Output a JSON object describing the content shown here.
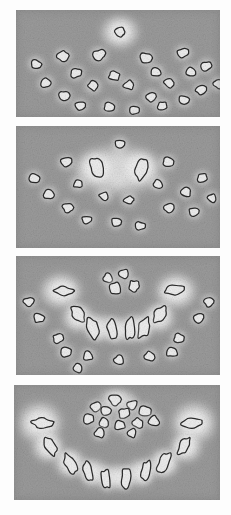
{
  "figure": {
    "panel_count": 4,
    "background_color": "#ffffff",
    "tissue_gray": "#9b9b9b",
    "bone_bright": "#f2f2f2",
    "halo_color": "#e4e4e4",
    "tooth_outline": "#2a2a2a",
    "tooth_fill": "#efefef"
  },
  "panels": [
    {
      "id": "panel-a",
      "label": "A",
      "caption": "Axial section — scattered tooth germs, single erupting crown at midline",
      "x": 16,
      "y": 10,
      "width": 204,
      "height": 107,
      "halos": [
        {
          "cx": 104,
          "cy": 22,
          "rx": 24,
          "ry": 21,
          "intensity": 0.95
        }
      ],
      "teeth": [
        {
          "cx": 104,
          "cy": 22,
          "rx": 5.5,
          "ry": 4.5,
          "rot": 10,
          "shape": "round"
        },
        {
          "cx": 47,
          "cy": 46,
          "rx": 5.5,
          "ry": 4.5,
          "rot": -15,
          "shape": "round"
        },
        {
          "cx": 83,
          "cy": 45,
          "rx": 6.0,
          "ry": 5.0,
          "rot": 5,
          "shape": "round"
        },
        {
          "cx": 130,
          "cy": 48,
          "rx": 5.5,
          "ry": 5.0,
          "rot": 20,
          "shape": "round"
        },
        {
          "cx": 167,
          "cy": 43,
          "rx": 5.5,
          "ry": 4.5,
          "rot": -10,
          "shape": "round"
        },
        {
          "cx": 20,
          "cy": 54,
          "rx": 5.0,
          "ry": 4.2,
          "rot": 25,
          "shape": "round"
        },
        {
          "cx": 190,
          "cy": 56,
          "rx": 5.0,
          "ry": 4.2,
          "rot": -20,
          "shape": "round"
        },
        {
          "cx": 60,
          "cy": 63,
          "rx": 5.2,
          "ry": 4.4,
          "rot": 0,
          "shape": "round"
        },
        {
          "cx": 98,
          "cy": 66,
          "rx": 5.2,
          "ry": 4.4,
          "rot": 15,
          "shape": "round"
        },
        {
          "cx": 140,
          "cy": 62,
          "rx": 5.2,
          "ry": 4.4,
          "rot": -5,
          "shape": "round"
        },
        {
          "cx": 175,
          "cy": 62,
          "rx": 5.0,
          "ry": 4.2,
          "rot": 10,
          "shape": "round"
        },
        {
          "cx": 30,
          "cy": 73,
          "rx": 5.0,
          "ry": 4.2,
          "rot": -25,
          "shape": "round"
        },
        {
          "cx": 202,
          "cy": 74,
          "rx": 4.8,
          "ry": 4.0,
          "rot": 15,
          "shape": "round"
        },
        {
          "cx": 77,
          "cy": 76,
          "rx": 5.2,
          "ry": 4.4,
          "rot": 5,
          "shape": "round"
        },
        {
          "cx": 113,
          "cy": 75,
          "rx": 5.2,
          "ry": 4.4,
          "rot": -12,
          "shape": "round"
        },
        {
          "cx": 153,
          "cy": 73,
          "rx": 5.0,
          "ry": 4.2,
          "rot": 8,
          "shape": "round"
        },
        {
          "cx": 185,
          "cy": 80,
          "rx": 4.8,
          "ry": 4.0,
          "rot": -8,
          "shape": "round"
        },
        {
          "cx": 48,
          "cy": 86,
          "rx": 5.0,
          "ry": 4.2,
          "rot": 18,
          "shape": "round"
        },
        {
          "cx": 135,
          "cy": 87,
          "rx": 5.0,
          "ry": 4.2,
          "rot": -18,
          "shape": "round"
        },
        {
          "cx": 168,
          "cy": 90,
          "rx": 5.0,
          "ry": 4.2,
          "rot": 12,
          "shape": "round"
        },
        {
          "cx": 64,
          "cy": 96,
          "rx": 4.8,
          "ry": 4.0,
          "rot": -5,
          "shape": "round"
        },
        {
          "cx": 93,
          "cy": 97,
          "rx": 5.0,
          "ry": 4.2,
          "rot": 10,
          "shape": "round"
        },
        {
          "cx": 118,
          "cy": 100,
          "rx": 4.6,
          "ry": 3.8,
          "rot": 0,
          "shape": "round"
        },
        {
          "cx": 146,
          "cy": 96,
          "rx": 4.8,
          "ry": 4.0,
          "rot": -15,
          "shape": "round"
        }
      ]
    },
    {
      "id": "panel-b",
      "label": "B",
      "caption": "Axial section — two central incisors within confluent bright follicle",
      "x": 16,
      "y": 126,
      "width": 204,
      "height": 122,
      "halos": [
        {
          "cx": 102,
          "cy": 44,
          "rx": 56,
          "ry": 32,
          "intensity": 0.92
        },
        {
          "cx": 80,
          "cy": 42,
          "rx": 24,
          "ry": 22,
          "intensity": 1.0
        },
        {
          "cx": 124,
          "cy": 42,
          "rx": 24,
          "ry": 22,
          "intensity": 1.0
        }
      ],
      "teeth": [
        {
          "cx": 81,
          "cy": 42,
          "rx": 5.5,
          "ry": 9.0,
          "rot": -20,
          "shape": "oval"
        },
        {
          "cx": 125,
          "cy": 43,
          "rx": 5.5,
          "ry": 10.0,
          "rot": 12,
          "shape": "oval"
        },
        {
          "cx": 104,
          "cy": 18,
          "rx": 4.6,
          "ry": 4.0,
          "rot": 0,
          "shape": "round"
        },
        {
          "cx": 50,
          "cy": 36,
          "rx": 5.2,
          "ry": 4.4,
          "rot": -10,
          "shape": "round"
        },
        {
          "cx": 152,
          "cy": 36,
          "rx": 5.2,
          "ry": 4.4,
          "rot": 10,
          "shape": "round"
        },
        {
          "cx": 18,
          "cy": 52,
          "rx": 5.0,
          "ry": 4.2,
          "rot": 20,
          "shape": "round"
        },
        {
          "cx": 186,
          "cy": 52,
          "rx": 5.0,
          "ry": 4.2,
          "rot": -20,
          "shape": "round"
        },
        {
          "cx": 62,
          "cy": 58,
          "rx": 4.8,
          "ry": 4.0,
          "rot": 0,
          "shape": "round"
        },
        {
          "cx": 142,
          "cy": 58,
          "rx": 4.8,
          "ry": 4.0,
          "rot": 0,
          "shape": "round"
        },
        {
          "cx": 33,
          "cy": 68,
          "rx": 5.2,
          "ry": 4.4,
          "rot": -15,
          "shape": "round"
        },
        {
          "cx": 170,
          "cy": 66,
          "rx": 5.0,
          "ry": 4.2,
          "rot": 15,
          "shape": "round"
        },
        {
          "cx": 196,
          "cy": 72,
          "rx": 4.8,
          "ry": 4.0,
          "rot": 5,
          "shape": "round"
        },
        {
          "cx": 88,
          "cy": 70,
          "rx": 4.8,
          "ry": 4.0,
          "rot": 8,
          "shape": "round"
        },
        {
          "cx": 113,
          "cy": 74,
          "rx": 4.8,
          "ry": 4.0,
          "rot": -8,
          "shape": "round"
        },
        {
          "cx": 52,
          "cy": 82,
          "rx": 5.0,
          "ry": 4.2,
          "rot": 12,
          "shape": "round"
        },
        {
          "cx": 153,
          "cy": 82,
          "rx": 5.0,
          "ry": 4.2,
          "rot": -12,
          "shape": "round"
        },
        {
          "cx": 178,
          "cy": 86,
          "rx": 4.8,
          "ry": 4.0,
          "rot": 0,
          "shape": "round"
        },
        {
          "cx": 71,
          "cy": 94,
          "rx": 4.8,
          "ry": 4.0,
          "rot": -5,
          "shape": "round"
        },
        {
          "cx": 100,
          "cy": 96,
          "rx": 4.8,
          "ry": 4.0,
          "rot": 10,
          "shape": "round"
        },
        {
          "cx": 124,
          "cy": 100,
          "rx": 4.6,
          "ry": 3.8,
          "rot": 0,
          "shape": "round"
        }
      ]
    },
    {
      "id": "panel-c",
      "label": "C",
      "caption": "Axial section — U-shaped alveolar arch with erupting anterior and posterior teeth",
      "x": 16,
      "y": 256,
      "width": 204,
      "height": 119,
      "halos": [
        {
          "cx": 45,
          "cy": 35,
          "rx": 26,
          "ry": 22,
          "intensity": 1.0
        },
        {
          "cx": 160,
          "cy": 35,
          "rx": 26,
          "ry": 22,
          "intensity": 1.0
        },
        {
          "cx": 62,
          "cy": 62,
          "rx": 20,
          "ry": 18,
          "intensity": 0.95
        },
        {
          "cx": 143,
          "cy": 62,
          "rx": 20,
          "ry": 18,
          "intensity": 0.95
        },
        {
          "cx": 84,
          "cy": 72,
          "rx": 17,
          "ry": 17,
          "intensity": 0.95
        },
        {
          "cx": 121,
          "cy": 72,
          "rx": 17,
          "ry": 17,
          "intensity": 0.95
        },
        {
          "cx": 102,
          "cy": 74,
          "rx": 16,
          "ry": 16,
          "intensity": 0.95
        }
      ],
      "teeth": [
        {
          "cx": 48,
          "cy": 35,
          "rx": 9.0,
          "ry": 4.6,
          "rot": 8,
          "shape": "oval"
        },
        {
          "cx": 158,
          "cy": 34,
          "rx": 9.0,
          "ry": 4.6,
          "rot": -8,
          "shape": "oval"
        },
        {
          "cx": 62,
          "cy": 58,
          "rx": 4.8,
          "ry": 8.5,
          "rot": -38,
          "shape": "oval"
        },
        {
          "cx": 144,
          "cy": 58,
          "rx": 4.8,
          "ry": 8.5,
          "rot": 38,
          "shape": "oval"
        },
        {
          "cx": 77,
          "cy": 72,
          "rx": 5.2,
          "ry": 10.0,
          "rot": -18,
          "shape": "oval"
        },
        {
          "cx": 128,
          "cy": 72,
          "rx": 5.2,
          "ry": 10.0,
          "rot": 18,
          "shape": "oval"
        },
        {
          "cx": 96,
          "cy": 73,
          "rx": 4.6,
          "ry": 10.0,
          "rot": -5,
          "shape": "oval"
        },
        {
          "cx": 114,
          "cy": 73,
          "rx": 4.6,
          "ry": 10.0,
          "rot": 5,
          "shape": "oval"
        },
        {
          "cx": 92,
          "cy": 22,
          "rx": 4.8,
          "ry": 4.2,
          "rot": 0,
          "shape": "round"
        },
        {
          "cx": 108,
          "cy": 18,
          "rx": 5.2,
          "ry": 4.6,
          "rot": 10,
          "shape": "round"
        },
        {
          "cx": 99,
          "cy": 32,
          "rx": 5.4,
          "ry": 6.0,
          "rot": -12,
          "shape": "oval"
        },
        {
          "cx": 118,
          "cy": 30,
          "rx": 4.8,
          "ry": 5.4,
          "rot": 14,
          "shape": "oval"
        },
        {
          "cx": 13,
          "cy": 46,
          "rx": 4.8,
          "ry": 4.2,
          "rot": 0,
          "shape": "round"
        },
        {
          "cx": 193,
          "cy": 46,
          "rx": 4.8,
          "ry": 4.2,
          "rot": 0,
          "shape": "round"
        },
        {
          "cx": 23,
          "cy": 62,
          "rx": 5.2,
          "ry": 4.4,
          "rot": 15,
          "shape": "round"
        },
        {
          "cx": 183,
          "cy": 62,
          "rx": 5.2,
          "ry": 4.4,
          "rot": -15,
          "shape": "round"
        },
        {
          "cx": 42,
          "cy": 82,
          "rx": 5.0,
          "ry": 4.4,
          "rot": -10,
          "shape": "round"
        },
        {
          "cx": 163,
          "cy": 82,
          "rx": 5.0,
          "ry": 4.4,
          "rot": 10,
          "shape": "round"
        },
        {
          "cx": 50,
          "cy": 96,
          "rx": 5.2,
          "ry": 4.6,
          "rot": 5,
          "shape": "round"
        },
        {
          "cx": 156,
          "cy": 96,
          "rx": 5.2,
          "ry": 4.6,
          "rot": -5,
          "shape": "round"
        },
        {
          "cx": 72,
          "cy": 100,
          "rx": 5.0,
          "ry": 4.4,
          "rot": 0,
          "shape": "round"
        },
        {
          "cx": 134,
          "cy": 100,
          "rx": 5.0,
          "ry": 4.4,
          "rot": 0,
          "shape": "round"
        },
        {
          "cx": 103,
          "cy": 104,
          "rx": 4.8,
          "ry": 4.2,
          "rot": 8,
          "shape": "round"
        },
        {
          "cx": 62,
          "cy": 112,
          "rx": 4.6,
          "ry": 4.0,
          "rot": 0,
          "shape": "round"
        }
      ]
    },
    {
      "id": "panel-d",
      "label": "D",
      "caption": "Axial section — complete mandibular arch with full complement of erupted teeth",
      "x": 14,
      "y": 385,
      "width": 206,
      "height": 115,
      "halos": [
        {
          "cx": 26,
          "cy": 38,
          "rx": 28,
          "ry": 26,
          "intensity": 1.0
        },
        {
          "cx": 180,
          "cy": 38,
          "rx": 28,
          "ry": 26,
          "intensity": 1.0
        },
        {
          "cx": 34,
          "cy": 62,
          "rx": 20,
          "ry": 19,
          "intensity": 0.97
        },
        {
          "cx": 172,
          "cy": 62,
          "rx": 20,
          "ry": 19,
          "intensity": 0.97
        },
        {
          "cx": 56,
          "cy": 78,
          "rx": 19,
          "ry": 18,
          "intensity": 0.97
        },
        {
          "cx": 150,
          "cy": 78,
          "rx": 19,
          "ry": 18,
          "intensity": 0.97
        },
        {
          "cx": 80,
          "cy": 88,
          "rx": 18,
          "ry": 17,
          "intensity": 0.97
        },
        {
          "cx": 126,
          "cy": 88,
          "rx": 18,
          "ry": 17,
          "intensity": 0.97
        },
        {
          "cx": 103,
          "cy": 92,
          "rx": 18,
          "ry": 16,
          "intensity": 0.97
        },
        {
          "cx": 103,
          "cy": 14,
          "rx": 22,
          "ry": 14,
          "intensity": 0.85
        }
      ],
      "teeth": [
        {
          "cx": 28,
          "cy": 38,
          "rx": 10.0,
          "ry": 4.4,
          "rot": 5,
          "shape": "oval"
        },
        {
          "cx": 178,
          "cy": 38,
          "rx": 10.0,
          "ry": 4.4,
          "rot": -5,
          "shape": "oval"
        },
        {
          "cx": 36,
          "cy": 61,
          "rx": 4.6,
          "ry": 9.5,
          "rot": -32,
          "shape": "oval"
        },
        {
          "cx": 170,
          "cy": 61,
          "rx": 4.6,
          "ry": 9.5,
          "rot": 32,
          "shape": "oval"
        },
        {
          "cx": 56,
          "cy": 78,
          "rx": 5.0,
          "ry": 10.0,
          "rot": -28,
          "shape": "oval"
        },
        {
          "cx": 150,
          "cy": 78,
          "rx": 5.0,
          "ry": 10.0,
          "rot": 28,
          "shape": "oval"
        },
        {
          "cx": 74,
          "cy": 86,
          "rx": 4.2,
          "ry": 9.0,
          "rot": -12,
          "shape": "oval"
        },
        {
          "cx": 132,
          "cy": 86,
          "rx": 4.6,
          "ry": 9.5,
          "rot": 12,
          "shape": "oval"
        },
        {
          "cx": 92,
          "cy": 94,
          "rx": 4.6,
          "ry": 9.5,
          "rot": -5,
          "shape": "oval"
        },
        {
          "cx": 112,
          "cy": 93,
          "rx": 4.6,
          "ry": 9.5,
          "rot": 5,
          "shape": "oval"
        },
        {
          "cx": 82,
          "cy": 22,
          "rx": 5.0,
          "ry": 4.4,
          "rot": 0,
          "shape": "round"
        },
        {
          "cx": 101,
          "cy": 15,
          "rx": 5.4,
          "ry": 4.8,
          "rot": 10,
          "shape": "round"
        },
        {
          "cx": 118,
          "cy": 20,
          "rx": 5.0,
          "ry": 4.6,
          "rot": -10,
          "shape": "round"
        },
        {
          "cx": 92,
          "cy": 26,
          "rx": 5.2,
          "ry": 4.8,
          "rot": 15,
          "shape": "round"
        },
        {
          "cx": 110,
          "cy": 28,
          "rx": 5.2,
          "ry": 4.8,
          "rot": -15,
          "shape": "round"
        },
        {
          "cx": 131,
          "cy": 26,
          "rx": 5.4,
          "ry": 5.0,
          "rot": 8,
          "shape": "round"
        },
        {
          "cx": 75,
          "cy": 34,
          "rx": 5.2,
          "ry": 4.6,
          "rot": -8,
          "shape": "round"
        },
        {
          "cx": 90,
          "cy": 38,
          "rx": 5.0,
          "ry": 4.6,
          "rot": 5,
          "shape": "round"
        },
        {
          "cx": 106,
          "cy": 40,
          "rx": 5.2,
          "ry": 4.8,
          "rot": -5,
          "shape": "round"
        },
        {
          "cx": 124,
          "cy": 38,
          "rx": 5.2,
          "ry": 4.8,
          "rot": 12,
          "shape": "round"
        },
        {
          "cx": 140,
          "cy": 36,
          "rx": 5.0,
          "ry": 4.6,
          "rot": -12,
          "shape": "round"
        },
        {
          "cx": 86,
          "cy": 48,
          "rx": 5.0,
          "ry": 4.4,
          "rot": 0,
          "shape": "round"
        },
        {
          "cx": 118,
          "cy": 48,
          "rx": 4.8,
          "ry": 4.4,
          "rot": 0,
          "shape": "round"
        }
      ]
    }
  ]
}
